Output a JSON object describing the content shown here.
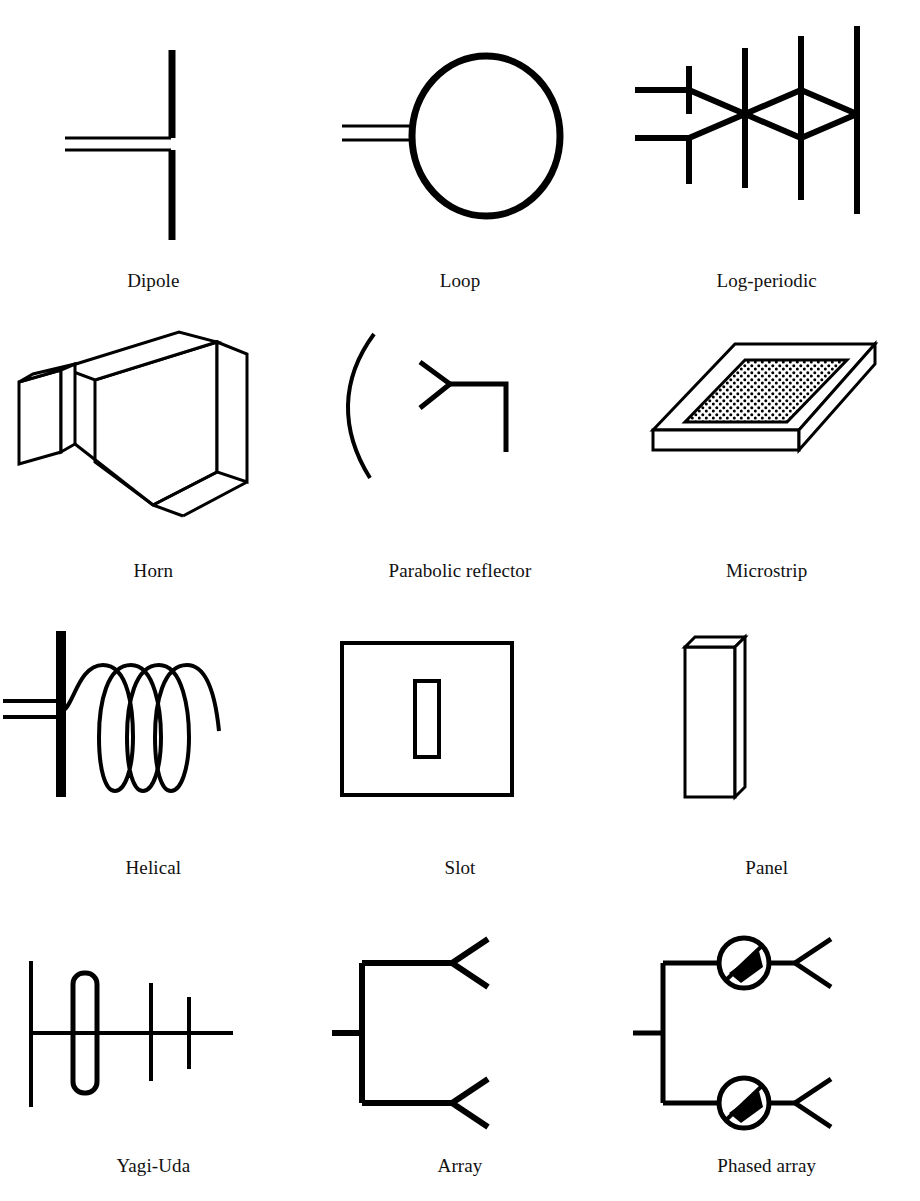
{
  "figure": {
    "background_color": "#ffffff",
    "ink_color": "#000000",
    "columns": 3,
    "rows": 4
  },
  "items": [
    {
      "id": "dipole",
      "label": "Dipole",
      "row": 1,
      "col": 1,
      "icon": "dipole-antenna-icon"
    },
    {
      "id": "loop",
      "label": "Loop",
      "row": 1,
      "col": 2,
      "icon": "loop-antenna-icon"
    },
    {
      "id": "log-periodic",
      "label": "Log-periodic",
      "row": 1,
      "col": 3,
      "icon": "log-periodic-antenna-icon"
    },
    {
      "id": "horn",
      "label": "Horn",
      "row": 2,
      "col": 1,
      "icon": "horn-antenna-icon"
    },
    {
      "id": "parabolic-reflector",
      "label": "Parabolic reflector",
      "row": 2,
      "col": 2,
      "icon": "parabolic-reflector-antenna-icon"
    },
    {
      "id": "microstrip",
      "label": "Microstrip",
      "row": 2,
      "col": 3,
      "icon": "microstrip-antenna-icon"
    },
    {
      "id": "helical",
      "label": "Helical",
      "row": 3,
      "col": 1,
      "icon": "helical-antenna-icon"
    },
    {
      "id": "slot",
      "label": "Slot",
      "row": 3,
      "col": 2,
      "icon": "slot-antenna-icon"
    },
    {
      "id": "panel",
      "label": "Panel",
      "row": 3,
      "col": 3,
      "icon": "panel-antenna-icon"
    },
    {
      "id": "yagi-uda",
      "label": "Yagi-Uda",
      "row": 4,
      "col": 1,
      "icon": "yagi-uda-antenna-icon"
    },
    {
      "id": "array",
      "label": "Array",
      "row": 4,
      "col": 2,
      "icon": "array-antenna-icon"
    },
    {
      "id": "phased-array",
      "label": "Phased array",
      "row": 4,
      "col": 3,
      "icon": "phased-array-antenna-icon"
    }
  ]
}
